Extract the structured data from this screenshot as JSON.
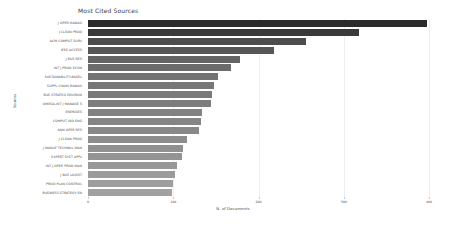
{
  "chart_data": {
    "type": "bar",
    "orientation": "horizontal",
    "title": "Most Cited Sources",
    "xlabel": "N. of Documents",
    "ylabel": "Sources",
    "xlim": [
      0,
      400
    ],
    "ylim": null,
    "grid": true,
    "legend": false,
    "xticks": [
      0,
      100,
      200,
      300,
      400
    ],
    "xticklabels": [
      "0",
      "100",
      "200",
      "300",
      "400"
    ],
    "categories": [
      "J OPER MANAG",
      "J CLEAN PROD",
      "ACM COMPUT SURV",
      "IEEE ACCESS",
      "J BUS RES",
      "INT J PROD ECON",
      "SUSTAINABILITY-BASEL",
      "SUPPL CHAIN MANAG",
      "BUS STRATEG ENVIRON",
      "OMEGA-INT J MANAGE S",
      "ENERGIES",
      "COMPUT IND ENG",
      "ANN OPER RES",
      "J CLEAN PROD",
      "J MANUF TECHNOL MAN",
      "EXPERT SYST APPL",
      "INT J OPER PROD MAN",
      "J BUS LOGIST",
      "PROD PLAN CONTROL",
      "BUSINESS STRATEGY EN"
    ],
    "values": [
      398,
      318,
      256,
      218,
      178,
      168,
      152,
      148,
      146,
      144,
      134,
      132,
      130,
      116,
      112,
      110,
      104,
      102,
      100,
      98
    ],
    "bar_colors": [
      "#2b2b2b",
      "#3a3a3a",
      "#4d4d4d",
      "#565656",
      "#646464",
      "#6c6c6c",
      "#737373",
      "#777777",
      "#7a7a7a",
      "#7d7d7d",
      "#828282",
      "#858585",
      "#888888",
      "#8d8d8d",
      "#919191",
      "#949494",
      "#989898",
      "#9b9b9b",
      "#9e9e9e",
      "#a1a1a1"
    ]
  }
}
